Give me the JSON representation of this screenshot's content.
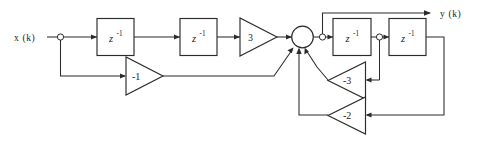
{
  "diagram": {
    "type": "block-diagram",
    "background_color": "#ffffff",
    "line_color": "#2b2b2b",
    "input": {
      "label": "x (k)"
    },
    "output": {
      "label": "y (k)"
    },
    "delay_blocks": [
      {
        "id": "z1",
        "base": "z",
        "exponent": "-1"
      },
      {
        "id": "z2",
        "base": "z",
        "exponent": "-1"
      },
      {
        "id": "z3",
        "base": "z",
        "exponent": "-1"
      },
      {
        "id": "z4",
        "base": "z",
        "exponent": "-1"
      }
    ],
    "gains": [
      {
        "id": "g-forward",
        "label": "3",
        "direction": "right"
      },
      {
        "id": "g-feedforward",
        "label": "-1",
        "direction": "right"
      },
      {
        "id": "g-fb-3",
        "label": "-3",
        "direction": "left"
      },
      {
        "id": "g-fb-2",
        "label": "-2",
        "direction": "left"
      }
    ],
    "summing_junction": {
      "id": "summer",
      "inputs": 4,
      "shape": "circle"
    },
    "junction_nodes": [
      {
        "id": "node-input-tap"
      },
      {
        "id": "node-output-tap"
      },
      {
        "id": "node-mid-tap"
      }
    ]
  }
}
